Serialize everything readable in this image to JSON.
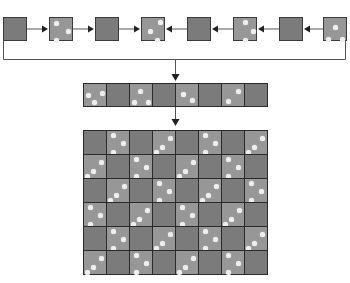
{
  "diagram": {
    "colors": {
      "dark_tile": "#7b7b7b",
      "light_tile": "#979797",
      "dot": "#eeeeee",
      "border": "#2a2a2a",
      "arrow": "#222222"
    },
    "top_row": {
      "tiles": [
        {
          "type": "dark",
          "dots": []
        },
        {
          "type": "light",
          "dots": [
            [
              4,
              3
            ],
            [
              16,
              11
            ],
            [
              4,
              20
            ]
          ]
        },
        {
          "type": "dark",
          "dots": []
        },
        {
          "type": "light",
          "dots": [
            [
              16,
              2
            ],
            [
              6,
              11
            ],
            [
              13,
              20
            ]
          ]
        },
        {
          "type": "dark",
          "dots": []
        },
        {
          "type": "light",
          "dots": [
            [
              9,
              2
            ],
            [
              17,
              11
            ],
            [
              9,
              20
            ]
          ]
        },
        {
          "type": "dark",
          "dots": []
        },
        {
          "type": "light",
          "dots": [
            [
              9,
              7
            ],
            [
              2,
              19
            ],
            [
              16,
              19
            ]
          ]
        }
      ],
      "arrow_directions": [
        "right",
        "right",
        "right",
        "left",
        "left",
        "left",
        "left"
      ]
    },
    "strip": {
      "cells": [
        {
          "type": "light",
          "dots": [
            [
              2,
              9
            ],
            [
              16,
              7
            ],
            [
              8,
              16
            ]
          ]
        },
        {
          "type": "dark",
          "dots": []
        },
        {
          "type": "light",
          "dots": [
            [
              8,
              5
            ],
            [
              2,
              16
            ],
            [
              16,
              16
            ]
          ]
        },
        {
          "type": "dark",
          "dots": []
        },
        {
          "type": "light",
          "dots": [
            [
              5,
              8
            ],
            [
              14,
              14
            ]
          ]
        },
        {
          "type": "dark",
          "dots": []
        },
        {
          "type": "light",
          "dots": [
            [
              14,
              5
            ],
            [
              4,
              15
            ]
          ]
        },
        {
          "type": "dark",
          "dots": []
        }
      ]
    },
    "grid": {
      "rows": 6,
      "cols": 8,
      "patterns": [
        [
          [
            13,
            2
          ],
          [
            4,
            10
          ],
          [
            14,
            19
          ]
        ],
        [
          [
            4,
            2
          ],
          [
            14,
            10
          ],
          [
            4,
            19
          ]
        ],
        [
          [
            8,
            4
          ],
          [
            2,
            12
          ],
          [
            16,
            16
          ]
        ],
        [
          [
            15,
            5
          ],
          [
            7,
            14
          ],
          [
            1,
            19
          ]
        ]
      ]
    }
  }
}
